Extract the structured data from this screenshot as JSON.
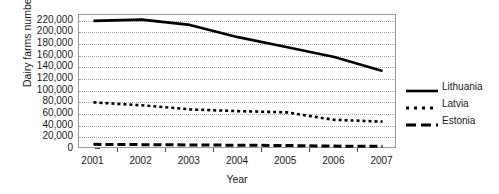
{
  "chart_data": {
    "type": "line",
    "title": "",
    "xlabel": "Year",
    "ylabel": "Dairy farms number",
    "x": [
      2001,
      2002,
      2003,
      2004,
      2005,
      2006,
      2007
    ],
    "xlim": [
      2000.7,
      2007.3
    ],
    "ylim": [
      0,
      230000
    ],
    "yticks": [
      0,
      20000,
      40000,
      60000,
      80000,
      100000,
      120000,
      140000,
      160000,
      180000,
      200000,
      220000
    ],
    "ytick_labels": [
      "0",
      "20,000",
      "40,000",
      "60,000",
      "80,000",
      "100,000",
      "120,000",
      "140,000",
      "160,000",
      "180,000",
      "200,000",
      "220,000"
    ],
    "xtick_labels": [
      "2001",
      "2002",
      "2003",
      "2004",
      "2005",
      "2006",
      "2007"
    ],
    "grid": true,
    "legend_position": "right",
    "series": [
      {
        "name": "Lithuania",
        "style": "solid",
        "color": "#000000",
        "values": [
          220000,
          222000,
          213000,
          192000,
          175000,
          158000,
          134000
        ]
      },
      {
        "name": "Latvia",
        "style": "dotted",
        "color": "#000000",
        "values": [
          80000,
          75000,
          68000,
          65000,
          63000,
          50000,
          47000
        ]
      },
      {
        "name": "Estonia",
        "style": "dashed",
        "color": "#000000",
        "values": [
          8000,
          7500,
          7000,
          6500,
          6000,
          5000,
          4500
        ]
      }
    ]
  },
  "legend": {
    "items": [
      {
        "label": "Lithuania",
        "style": "solid"
      },
      {
        "label": "Latvia",
        "style": "dotted"
      },
      {
        "label": "Estonia",
        "style": "dashed"
      }
    ]
  }
}
